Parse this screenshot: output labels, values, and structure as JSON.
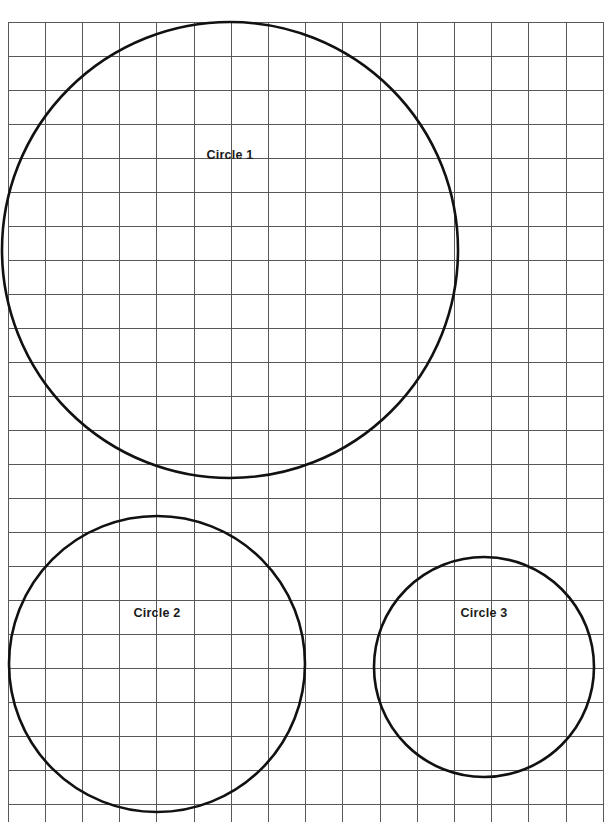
{
  "page": {
    "background_color": "#ffffff",
    "width": 605,
    "height": 822
  },
  "grid": {
    "name": "square-grid",
    "line_color": "#58585a",
    "line_width": 1,
    "origin_x": 8,
    "origin_y": 22,
    "cell_width": 37.2,
    "cell_height": 34.0,
    "columns": 16,
    "rows": 24
  },
  "chart_data": {
    "type": "scatter",
    "title": "",
    "xlabel": "",
    "ylabel": "",
    "grid": true,
    "legend": "none",
    "xlim": [
      0,
      605
    ],
    "ylim": [
      822,
      0
    ],
    "shapes": [
      {
        "name": "circle-1",
        "label": "Circle 1",
        "center_x": 230,
        "center_y": 250,
        "radius": 228,
        "stroke": "#111111",
        "stroke_width": 2.6,
        "fill": "none",
        "label_x": 230,
        "label_y": 156
      },
      {
        "name": "circle-2",
        "label": "Circle 2",
        "center_x": 157,
        "center_y": 664,
        "radius": 148,
        "stroke": "#111111",
        "stroke_width": 2.6,
        "fill": "none",
        "label_x": 157,
        "label_y": 614
      },
      {
        "name": "circle-3",
        "label": "Circle 3",
        "center_x": 484,
        "center_y": 667,
        "radius": 110,
        "stroke": "#111111",
        "stroke_width": 2.6,
        "fill": "none",
        "label_x": 484,
        "label_y": 614
      }
    ]
  },
  "labels": {
    "circle_1": "Circle 1",
    "circle_2": "Circle 2",
    "circle_3": "Circle 3"
  }
}
